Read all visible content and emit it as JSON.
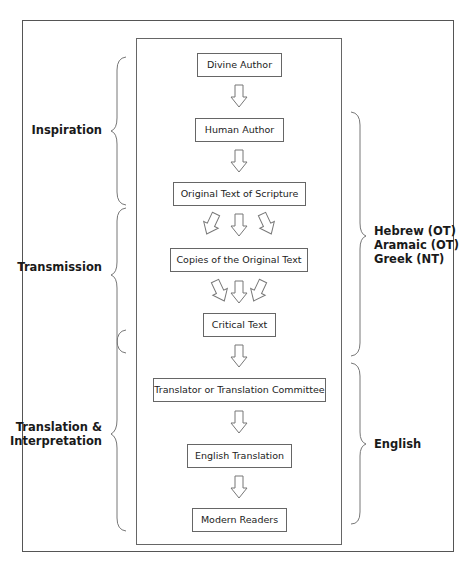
{
  "diagram": {
    "boxes": [
      {
        "label": "Divine Author"
      },
      {
        "label": "Human Author"
      },
      {
        "label": "Original Text of Scripture"
      },
      {
        "label": "Copies of the Original Text"
      },
      {
        "label": "Critical Text"
      },
      {
        "label": "Translator or Translation Committee"
      },
      {
        "label": "English Translation"
      },
      {
        "label": "Modern Readers"
      }
    ],
    "left_stages": [
      {
        "label": "Inspiration"
      },
      {
        "label": "Transmission"
      },
      {
        "label": "Translation &",
        "label2": "Interpretation"
      }
    ],
    "right_languages": [
      {
        "lines": [
          "Hebrew (OT)",
          "Aramaic (OT)",
          "Greek (NT)"
        ]
      },
      {
        "lines": [
          "English"
        ]
      }
    ],
    "colors": {
      "border": "#666666",
      "text": "#1a1a1a",
      "background": "#ffffff"
    }
  }
}
